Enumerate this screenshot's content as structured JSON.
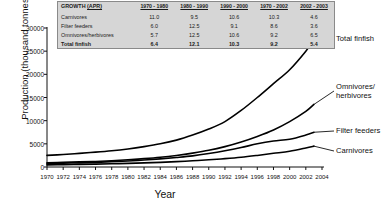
{
  "chart_data": {
    "type": "line",
    "title": "",
    "xlabel": "Year",
    "ylabel": "Production (thousand tonnes)",
    "xlim": [
      1970,
      2004
    ],
    "ylim": [
      0,
      30000
    ],
    "grid": false,
    "legend_position": "right-inline-callouts",
    "x_ticks": [
      1970,
      1972,
      1974,
      1976,
      1978,
      1980,
      1982,
      1984,
      1986,
      1988,
      1990,
      1992,
      1994,
      1996,
      1998,
      2000,
      2002,
      2004
    ],
    "y_ticks": [
      0,
      5000,
      10000,
      15000,
      20000,
      25000,
      30000
    ],
    "x": [
      1970,
      1972,
      1974,
      1976,
      1978,
      1980,
      1982,
      1984,
      1986,
      1988,
      1990,
      1992,
      1994,
      1996,
      1998,
      2000,
      2002,
      2003
    ],
    "series": [
      {
        "name": "Total finfish",
        "color": "#000000",
        "values": [
          2500,
          2700,
          2950,
          3200,
          3500,
          3900,
          4400,
          5000,
          5800,
          6900,
          8200,
          9800,
          12200,
          15000,
          18000,
          21000,
          25000,
          27500
        ]
      },
      {
        "name": "Omnivores/herbivores",
        "color": "#000000",
        "values": [
          900,
          1000,
          1100,
          1200,
          1350,
          1550,
          1800,
          2100,
          2500,
          3000,
          3600,
          4400,
          5400,
          6600,
          8000,
          9800,
          12000,
          13500
        ]
      },
      {
        "name": "Filter feeders",
        "color": "#000000",
        "values": [
          700,
          800,
          900,
          1000,
          1150,
          1300,
          1500,
          1750,
          2050,
          2400,
          2900,
          3500,
          4200,
          5000,
          5600,
          6000,
          6900,
          7500
        ]
      },
      {
        "name": "Carnivores",
        "color": "#000000",
        "values": [
          450,
          500,
          560,
          620,
          700,
          780,
          880,
          1000,
          1150,
          1350,
          1550,
          1800,
          2100,
          2500,
          2950,
          3400,
          4100,
          4500
        ]
      }
    ],
    "callouts": [
      {
        "label": "Total finfish"
      },
      {
        "label": "Omnivores/",
        "label2": "herbivores"
      },
      {
        "label": "Filter feeders"
      },
      {
        "label": "Carnivores"
      }
    ]
  },
  "growth_table": {
    "title": "GROWTH",
    "title_suffix": "(APR)",
    "columns": [
      "1970 - 1980",
      "1980 - 1990",
      "1990 - 2000",
      "1970 - 2002",
      "2002 - 2003"
    ],
    "rows": [
      {
        "name": "Carnivores",
        "values": [
          "11.0",
          "9.5",
          "10.6",
          "10.3",
          "4.6"
        ]
      },
      {
        "name": "Filter feeders",
        "values": [
          "6.0",
          "12.5",
          "9.1",
          "8.6",
          "3.6"
        ]
      },
      {
        "name": "Omnivores/herbivores",
        "values": [
          "5.7",
          "12.5",
          "10.6",
          "9.2",
          "6.5"
        ]
      },
      {
        "name": "Total finfish",
        "values": [
          "6.4",
          "12.1",
          "10.3",
          "9.2",
          "5.4"
        ]
      }
    ]
  },
  "axes": {
    "y_title": "Production (thousand tonnes)",
    "x_title": "Year"
  }
}
